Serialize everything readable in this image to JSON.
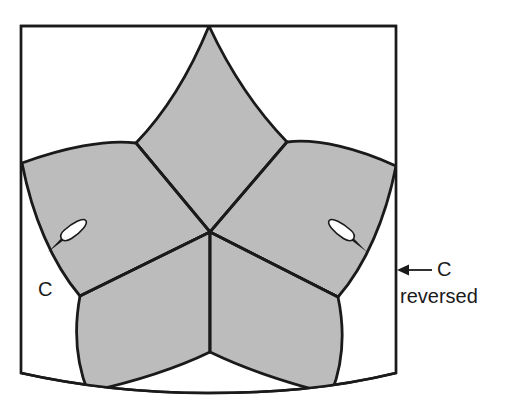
{
  "figure": {
    "background_color": "#ffffff",
    "line_color": "#1a1a1a",
    "petal_fill_color": "#bcbcbc",
    "frame_fill_color": "#ffffff",
    "pin_fill_color": "#ffffff",
    "pin_tip_color": "#1a1a1a"
  },
  "annotations": {
    "left_label": "C",
    "right_label_line1": "C",
    "right_label_line2": "reversed",
    "top_clipped_text": ""
  },
  "icons": {
    "pin_left": "pin-icon",
    "pin_right": "pin-icon-mirrored",
    "arrow": "arrow-left-icon"
  },
  "geometry": {
    "frame": {
      "top_y": 26,
      "left_x": 21,
      "right_x": 396,
      "bottom_y": 373,
      "bottom_curve_sag": 14
    },
    "center_point": {
      "x": 210,
      "y": 232
    },
    "petal_count": 5,
    "petal_tips": [
      {
        "name": "top",
        "x": 209,
        "y": 26
      },
      {
        "name": "upper-left",
        "x": 22,
        "y": 163
      },
      {
        "name": "upper-right",
        "x": 396,
        "y": 166
      },
      {
        "name": "lower-left",
        "x": 88,
        "y": 386
      },
      {
        "name": "lower-right",
        "x": 330,
        "y": 388
      }
    ],
    "pins": [
      {
        "name": "left-pin",
        "x": 68,
        "y": 236,
        "angle": -30
      },
      {
        "name": "right-pin",
        "x": 345,
        "y": 236,
        "angle": 30
      }
    ],
    "arrow": {
      "from_x": 432,
      "to_x": 398,
      "y": 270
    }
  }
}
